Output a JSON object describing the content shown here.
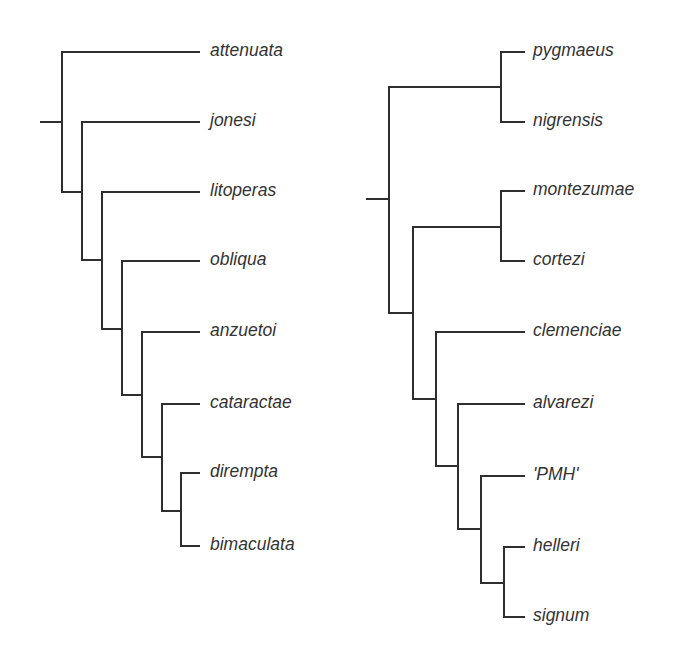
{
  "diagram": {
    "type": "cladogram",
    "trees": [
      {
        "id": "left",
        "root": {
          "x1": 41,
          "x2": 62,
          "y": 122
        },
        "taxa": [
          {
            "name": "attenuata",
            "y": 52,
            "x_start": 62
          },
          {
            "name": "jonesi",
            "y": 122,
            "x_start": 82
          },
          {
            "name": "litoperas",
            "y": 192,
            "x_start": 102
          },
          {
            "name": "obliqua",
            "y": 261,
            "x_start": 122
          },
          {
            "name": "anzuetoi",
            "y": 332,
            "x_start": 142
          },
          {
            "name": "cataractae",
            "y": 404,
            "x_start": 162
          },
          {
            "name": "dirempta",
            "y": 473,
            "x_start": 181
          },
          {
            "name": "bimaculata",
            "y": 546,
            "x_start": 181
          }
        ],
        "tip_x": 199,
        "label_x": 210,
        "verticals": [
          {
            "x": 62,
            "y1": 52,
            "y2": 192
          },
          {
            "x": 82,
            "y1": 122,
            "y2": 260
          },
          {
            "x": 102,
            "y1": 192,
            "y2": 329
          },
          {
            "x": 122,
            "y1": 261,
            "y2": 395
          },
          {
            "x": 142,
            "y1": 332,
            "y2": 457
          },
          {
            "x": 162,
            "y1": 404,
            "y2": 511
          },
          {
            "x": 181,
            "y1": 473,
            "y2": 546
          }
        ],
        "connectors": [
          {
            "x1": 62,
            "x2": 82,
            "y": 192
          },
          {
            "x1": 82,
            "x2": 102,
            "y": 260
          },
          {
            "x1": 102,
            "x2": 122,
            "y": 329
          },
          {
            "x1": 122,
            "x2": 142,
            "y": 395
          },
          {
            "x1": 142,
            "x2": 162,
            "y": 457
          },
          {
            "x1": 162,
            "x2": 181,
            "y": 511
          }
        ]
      },
      {
        "id": "right",
        "root": {
          "x1": 367,
          "x2": 389,
          "y": 199
        },
        "taxa": [
          {
            "name": "pygmaeus",
            "y": 52,
            "x_start": 501
          },
          {
            "name": "nigrensis",
            "y": 122,
            "x_start": 501
          },
          {
            "name": "montezumae",
            "y": 191,
            "x_start": 501
          },
          {
            "name": "cortezi",
            "y": 261,
            "x_start": 501
          },
          {
            "name": "clemenciae",
            "y": 332,
            "x_start": 436
          },
          {
            "name": "alvarezi",
            "y": 404,
            "x_start": 458
          },
          {
            "name": "'PMH'",
            "y": 476,
            "x_start": 481
          },
          {
            "name": "helleri",
            "y": 547,
            "x_start": 504
          },
          {
            "name": "signum",
            "y": 617,
            "x_start": 504
          }
        ],
        "tip_x": 524,
        "label_x": 533,
        "verticals": [
          {
            "x": 501,
            "y1": 52,
            "y2": 122
          },
          {
            "x": 501,
            "y1": 191,
            "y2": 261
          },
          {
            "x": 389,
            "y1": 87,
            "y2": 313
          },
          {
            "x": 413,
            "y1": 227,
            "y2": 399
          },
          {
            "x": 436,
            "y1": 332,
            "y2": 466
          },
          {
            "x": 458,
            "y1": 404,
            "y2": 529
          },
          {
            "x": 481,
            "y1": 476,
            "y2": 583
          },
          {
            "x": 504,
            "y1": 547,
            "y2": 617
          }
        ],
        "connectors": [
          {
            "x1": 389,
            "x2": 501,
            "y": 87
          },
          {
            "x1": 413,
            "x2": 501,
            "y": 227
          },
          {
            "x1": 389,
            "x2": 413,
            "y": 313
          },
          {
            "x1": 413,
            "x2": 436,
            "y": 399
          },
          {
            "x1": 436,
            "x2": 458,
            "y": 466
          },
          {
            "x1": 458,
            "x2": 481,
            "y": 529
          },
          {
            "x1": 481,
            "x2": 504,
            "y": 583
          }
        ]
      }
    ]
  },
  "colors": {
    "line": "#2e2e2e",
    "text": "#333333",
    "background": "#ffffff"
  }
}
